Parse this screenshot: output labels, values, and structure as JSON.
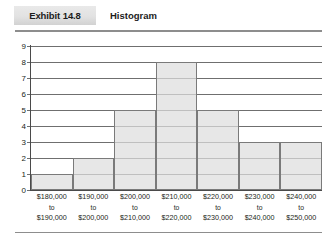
{
  "header": {
    "exhibit_label": "Exhibit 14.8",
    "title": "Histogram"
  },
  "chart_data": {
    "type": "bar",
    "title": "Histogram",
    "xlabel": "",
    "ylabel": "",
    "ylim": [
      0,
      9
    ],
    "yticks": [
      "0",
      "1",
      "2",
      "3",
      "4",
      "5",
      "6",
      "7",
      "8",
      "9"
    ],
    "grid": true,
    "legend": null,
    "categories": [
      "$180,000 to $190,000",
      "$190,000 to $200,000",
      "$200,000 to $210,000",
      "$210,000 to $220,000",
      "$220,000 to $230,000",
      "$230,000 to $240,000",
      "$240,000 to $250,000"
    ],
    "values": [
      1,
      2,
      5,
      8,
      5,
      3,
      3
    ],
    "bins": [
      {
        "low": "$180,000",
        "mid": "to",
        "high": "$190,000",
        "value": 1
      },
      {
        "low": "$190,000",
        "mid": "to",
        "high": "$200,000",
        "value": 2
      },
      {
        "low": "$200,000",
        "mid": "to",
        "high": "$210,000",
        "value": 5
      },
      {
        "low": "$210,000",
        "mid": "to",
        "high": "$220,000",
        "value": 8
      },
      {
        "low": "$220,000",
        "mid": "to",
        "high": "$230,000",
        "value": 5
      },
      {
        "low": "$230,000",
        "mid": "to",
        "high": "$240,000",
        "value": 3
      },
      {
        "low": "$240,000",
        "mid": "to",
        "high": "$250,000",
        "value": 3
      }
    ],
    "colors": {
      "bar_fill": "#dedede",
      "bar_border": "#7a7a7a",
      "gridline": "#6f6f6f",
      "axis": "#4a4a4a",
      "text": "#231f20",
      "tab_background": "#e2e2e2"
    }
  }
}
